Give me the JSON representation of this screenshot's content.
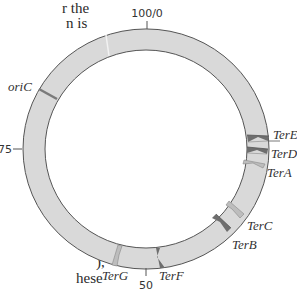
{
  "text_fragments": {
    "top_line1": "r the",
    "top_line2": "n is",
    "bottom_line1": "),",
    "bottom_line2": "hese"
  },
  "diagram": {
    "type": "circular chromosome map",
    "positions": {
      "top": "100/0",
      "left": "75",
      "bottom": "50"
    },
    "origin": {
      "label": "oriC"
    },
    "ter_sites": [
      {
        "label": "TerE"
      },
      {
        "label": "TerD"
      },
      {
        "label": "TerA"
      },
      {
        "label": "TerC"
      },
      {
        "label": "TerB"
      },
      {
        "label": "TerF"
      },
      {
        "label": "TerG"
      }
    ],
    "colors": {
      "ring_fill": "#d9d9d9",
      "ring_stroke": "#555555",
      "marker_dark": "#6e6e6e",
      "marker_light": "#bdbdbd",
      "oriC": "#7a7a7a"
    }
  }
}
